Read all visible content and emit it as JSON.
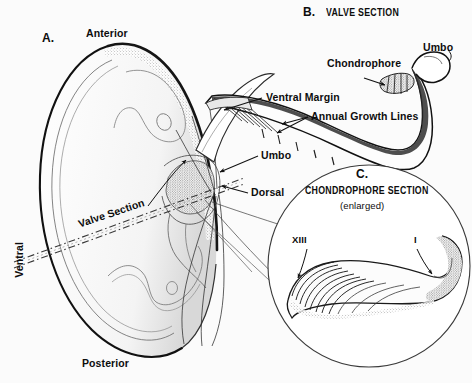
{
  "figure": {
    "background_color": "#fbfbfb",
    "ink_color": "#111111"
  },
  "panels": {
    "a": {
      "letter": "A.",
      "labels": {
        "anterior": "Anterior",
        "posterior": "Posterior",
        "ventral": "Ventral",
        "dorsal": "Dorsal",
        "umbo": "Umbo",
        "valve_section": "Valve Section"
      }
    },
    "b": {
      "letter": "B.",
      "title": "VALVE SECTION",
      "labels": {
        "chondrophore": "Chondrophore",
        "umbo": "Umbo",
        "ventral_margin": "Ventral  Margin",
        "annual_growth_lines": "Annual Growth Lines"
      }
    },
    "c": {
      "letter": "C.",
      "title": "CHONDROPHORE SECTION",
      "subtitle": "(enlarged)",
      "labels": {
        "outer_ring": "XIII",
        "inner_ring": "I"
      }
    }
  }
}
